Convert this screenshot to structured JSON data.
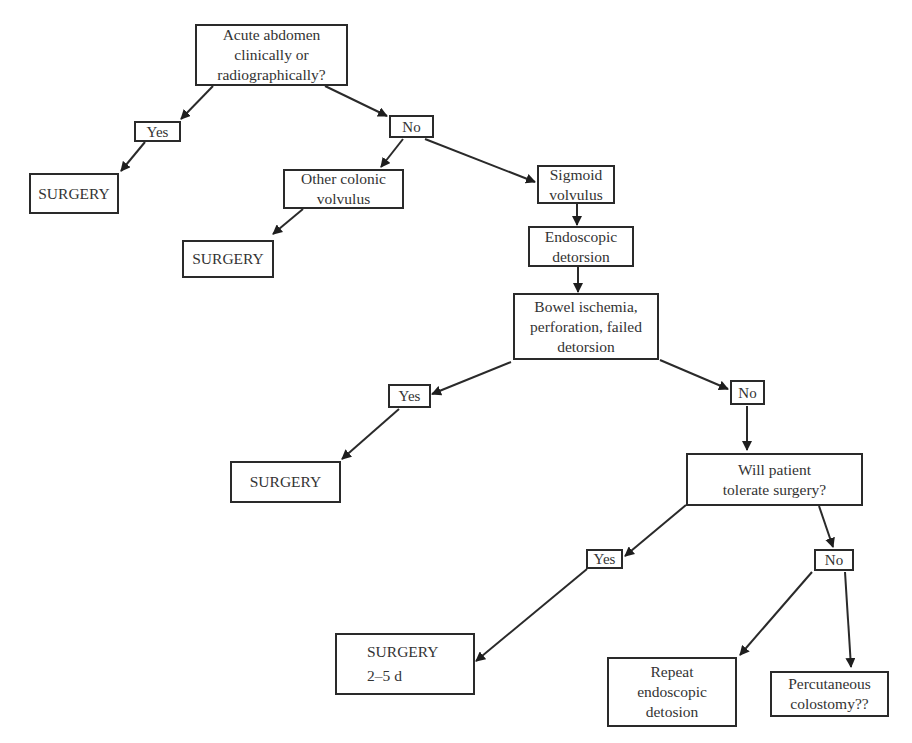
{
  "diagram": {
    "type": "flowchart",
    "nodes": [
      {
        "id": "acute_abdomen",
        "text": "Acute abdomen\nclinically or\nradiographically?",
        "box": [
          195,
          24,
          153,
          62
        ]
      },
      {
        "id": "yes_1",
        "text": "Yes",
        "box": [
          134,
          121,
          47,
          21
        ]
      },
      {
        "id": "surgery_1",
        "text": "SURGERY",
        "box": [
          29,
          173,
          90,
          41
        ]
      },
      {
        "id": "no_1",
        "text": "No",
        "box": [
          389,
          115,
          45,
          23
        ]
      },
      {
        "id": "other_colonic",
        "text": "Other colonic\nvolvulus",
        "box": [
          283,
          169,
          121,
          40
        ]
      },
      {
        "id": "surgery_2",
        "text": "SURGERY",
        "box": [
          182,
          240,
          92,
          38
        ]
      },
      {
        "id": "sigmoid_volvulus",
        "text": "Sigmoid\nvolvulus",
        "box": [
          537,
          165,
          78,
          39
        ]
      },
      {
        "id": "endoscopic_detorsion",
        "text": "Endoscopic\ndetorsion",
        "box": [
          528,
          226,
          106,
          41
        ]
      },
      {
        "id": "bowel_ischemia",
        "text": "Bowel ischemia,\nperforation, failed\ndetorsion",
        "box": [
          513,
          293,
          146,
          67
        ]
      },
      {
        "id": "yes_2",
        "text": "Yes",
        "box": [
          388,
          384,
          43,
          24
        ]
      },
      {
        "id": "no_2",
        "text": "No",
        "box": [
          730,
          380,
          35,
          25
        ]
      },
      {
        "id": "surgery_3",
        "text": "SURGERY",
        "box": [
          230,
          461,
          111,
          42
        ]
      },
      {
        "id": "will_tolerate",
        "text": "Will patient\ntolerate surgery?",
        "box": [
          686,
          453,
          177,
          53
        ]
      },
      {
        "id": "yes_3",
        "text": "Yes",
        "box": [
          586,
          549,
          37,
          20
        ]
      },
      {
        "id": "no_3",
        "text": "No",
        "box": [
          814,
          549,
          40,
          22
        ]
      },
      {
        "id": "surgery_delayed",
        "text": "SURGERY",
        "subtext": "2–5 d",
        "box": [
          335,
          633,
          140,
          62
        ]
      },
      {
        "id": "repeat_endoscopic",
        "text": "Repeat\nendoscopic\ndetosion",
        "box": [
          607,
          657,
          130,
          70
        ]
      },
      {
        "id": "percutaneous_colostomy",
        "text": "Percutaneous\ncolostomy??",
        "box": [
          770,
          671,
          119,
          46
        ]
      }
    ],
    "edges": [
      {
        "from": "acute_abdomen",
        "to": "yes_1",
        "path": [
          213,
          86,
          181,
          119
        ]
      },
      {
        "from": "acute_abdomen",
        "to": "no_1",
        "path": [
          325,
          86,
          387,
          116
        ]
      },
      {
        "from": "yes_1",
        "to": "surgery_1",
        "path": [
          145,
          142,
          121,
          171
        ]
      },
      {
        "from": "no_1",
        "to": "other_colonic",
        "path": [
          403,
          139,
          381,
          167
        ]
      },
      {
        "from": "no_1",
        "to": "sigmoid_volvulus",
        "path": [
          425,
          139,
          535,
          182
        ]
      },
      {
        "from": "other_colonic",
        "to": "surgery_2",
        "path": [
          303,
          209,
          273,
          234
        ]
      },
      {
        "from": "sigmoid_volvulus",
        "to": "endoscopic_detorsion",
        "path": [
          577,
          204,
          577,
          225
        ]
      },
      {
        "from": "endoscopic_detorsion",
        "to": "bowel_ischemia",
        "path": [
          578,
          267,
          578,
          292
        ]
      },
      {
        "from": "bowel_ischemia",
        "to": "yes_2",
        "path": [
          511,
          362,
          432,
          394
        ]
      },
      {
        "from": "bowel_ischemia",
        "to": "no_2",
        "path": [
          660,
          360,
          728,
          389
        ]
      },
      {
        "from": "yes_2",
        "to": "surgery_3",
        "path": [
          399,
          409,
          342,
          459
        ]
      },
      {
        "from": "no_2",
        "to": "will_tolerate",
        "path": [
          747,
          406,
          747,
          450
        ]
      },
      {
        "from": "will_tolerate",
        "to": "yes_3",
        "path": [
          686,
          505,
          625,
          556
        ]
      },
      {
        "from": "will_tolerate",
        "to": "no_3",
        "path": [
          819,
          506,
          833,
          547
        ]
      },
      {
        "from": "yes_3",
        "to": "surgery_delayed",
        "path": [
          587,
          569,
          476,
          661
        ]
      },
      {
        "from": "no_3",
        "to": "repeat_endoscopic",
        "path": [
          812,
          572,
          740,
          655
        ]
      },
      {
        "from": "no_3",
        "to": "percutaneous_colostomy",
        "path": [
          845,
          572,
          851,
          667
        ]
      }
    ],
    "colors": {
      "line": "#2a2a2a",
      "text": "#333333",
      "background": "#ffffff"
    }
  }
}
